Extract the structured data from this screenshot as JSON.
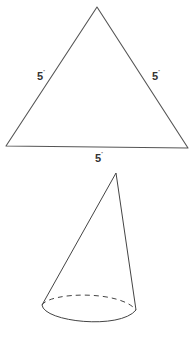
{
  "triangle": {
    "labels": {
      "left": "5",
      "right": "5",
      "bottom": "5"
    },
    "unit_mark": "''",
    "stroke_color": "#555555"
  },
  "cone": {
    "base_edge_back": "dashed",
    "stroke_color": "#444444"
  }
}
